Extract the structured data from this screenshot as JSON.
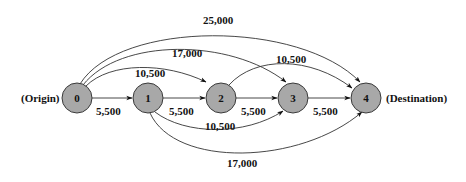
{
  "diagram": {
    "type": "network",
    "nodes": [
      {
        "id": "0",
        "label": "0",
        "cx": 77,
        "cy": 98
      },
      {
        "id": "1",
        "label": "1",
        "cx": 148,
        "cy": 98
      },
      {
        "id": "2",
        "label": "2",
        "cx": 221,
        "cy": 98
      },
      {
        "id": "3",
        "label": "3",
        "cx": 293,
        "cy": 98
      },
      {
        "id": "4",
        "label": "4",
        "cx": 366,
        "cy": 98
      }
    ],
    "origin_label": "(Origin)",
    "destination_label": "(Destination)",
    "edges": [
      {
        "from": "0",
        "to": "1",
        "label": "5,500"
      },
      {
        "from": "1",
        "to": "2",
        "label": "5,500"
      },
      {
        "from": "2",
        "to": "3",
        "label": "5,500"
      },
      {
        "from": "3",
        "to": "4",
        "label": "5,500"
      },
      {
        "from": "0",
        "to": "2",
        "label": "10,500"
      },
      {
        "from": "0",
        "to": "3",
        "label": "17,000"
      },
      {
        "from": "0",
        "to": "4",
        "label": "25,000"
      },
      {
        "from": "1",
        "to": "3",
        "label": "10,500"
      },
      {
        "from": "1",
        "to": "4",
        "label": "17,000"
      },
      {
        "from": "2",
        "to": "4",
        "label": "10,500"
      }
    ]
  }
}
